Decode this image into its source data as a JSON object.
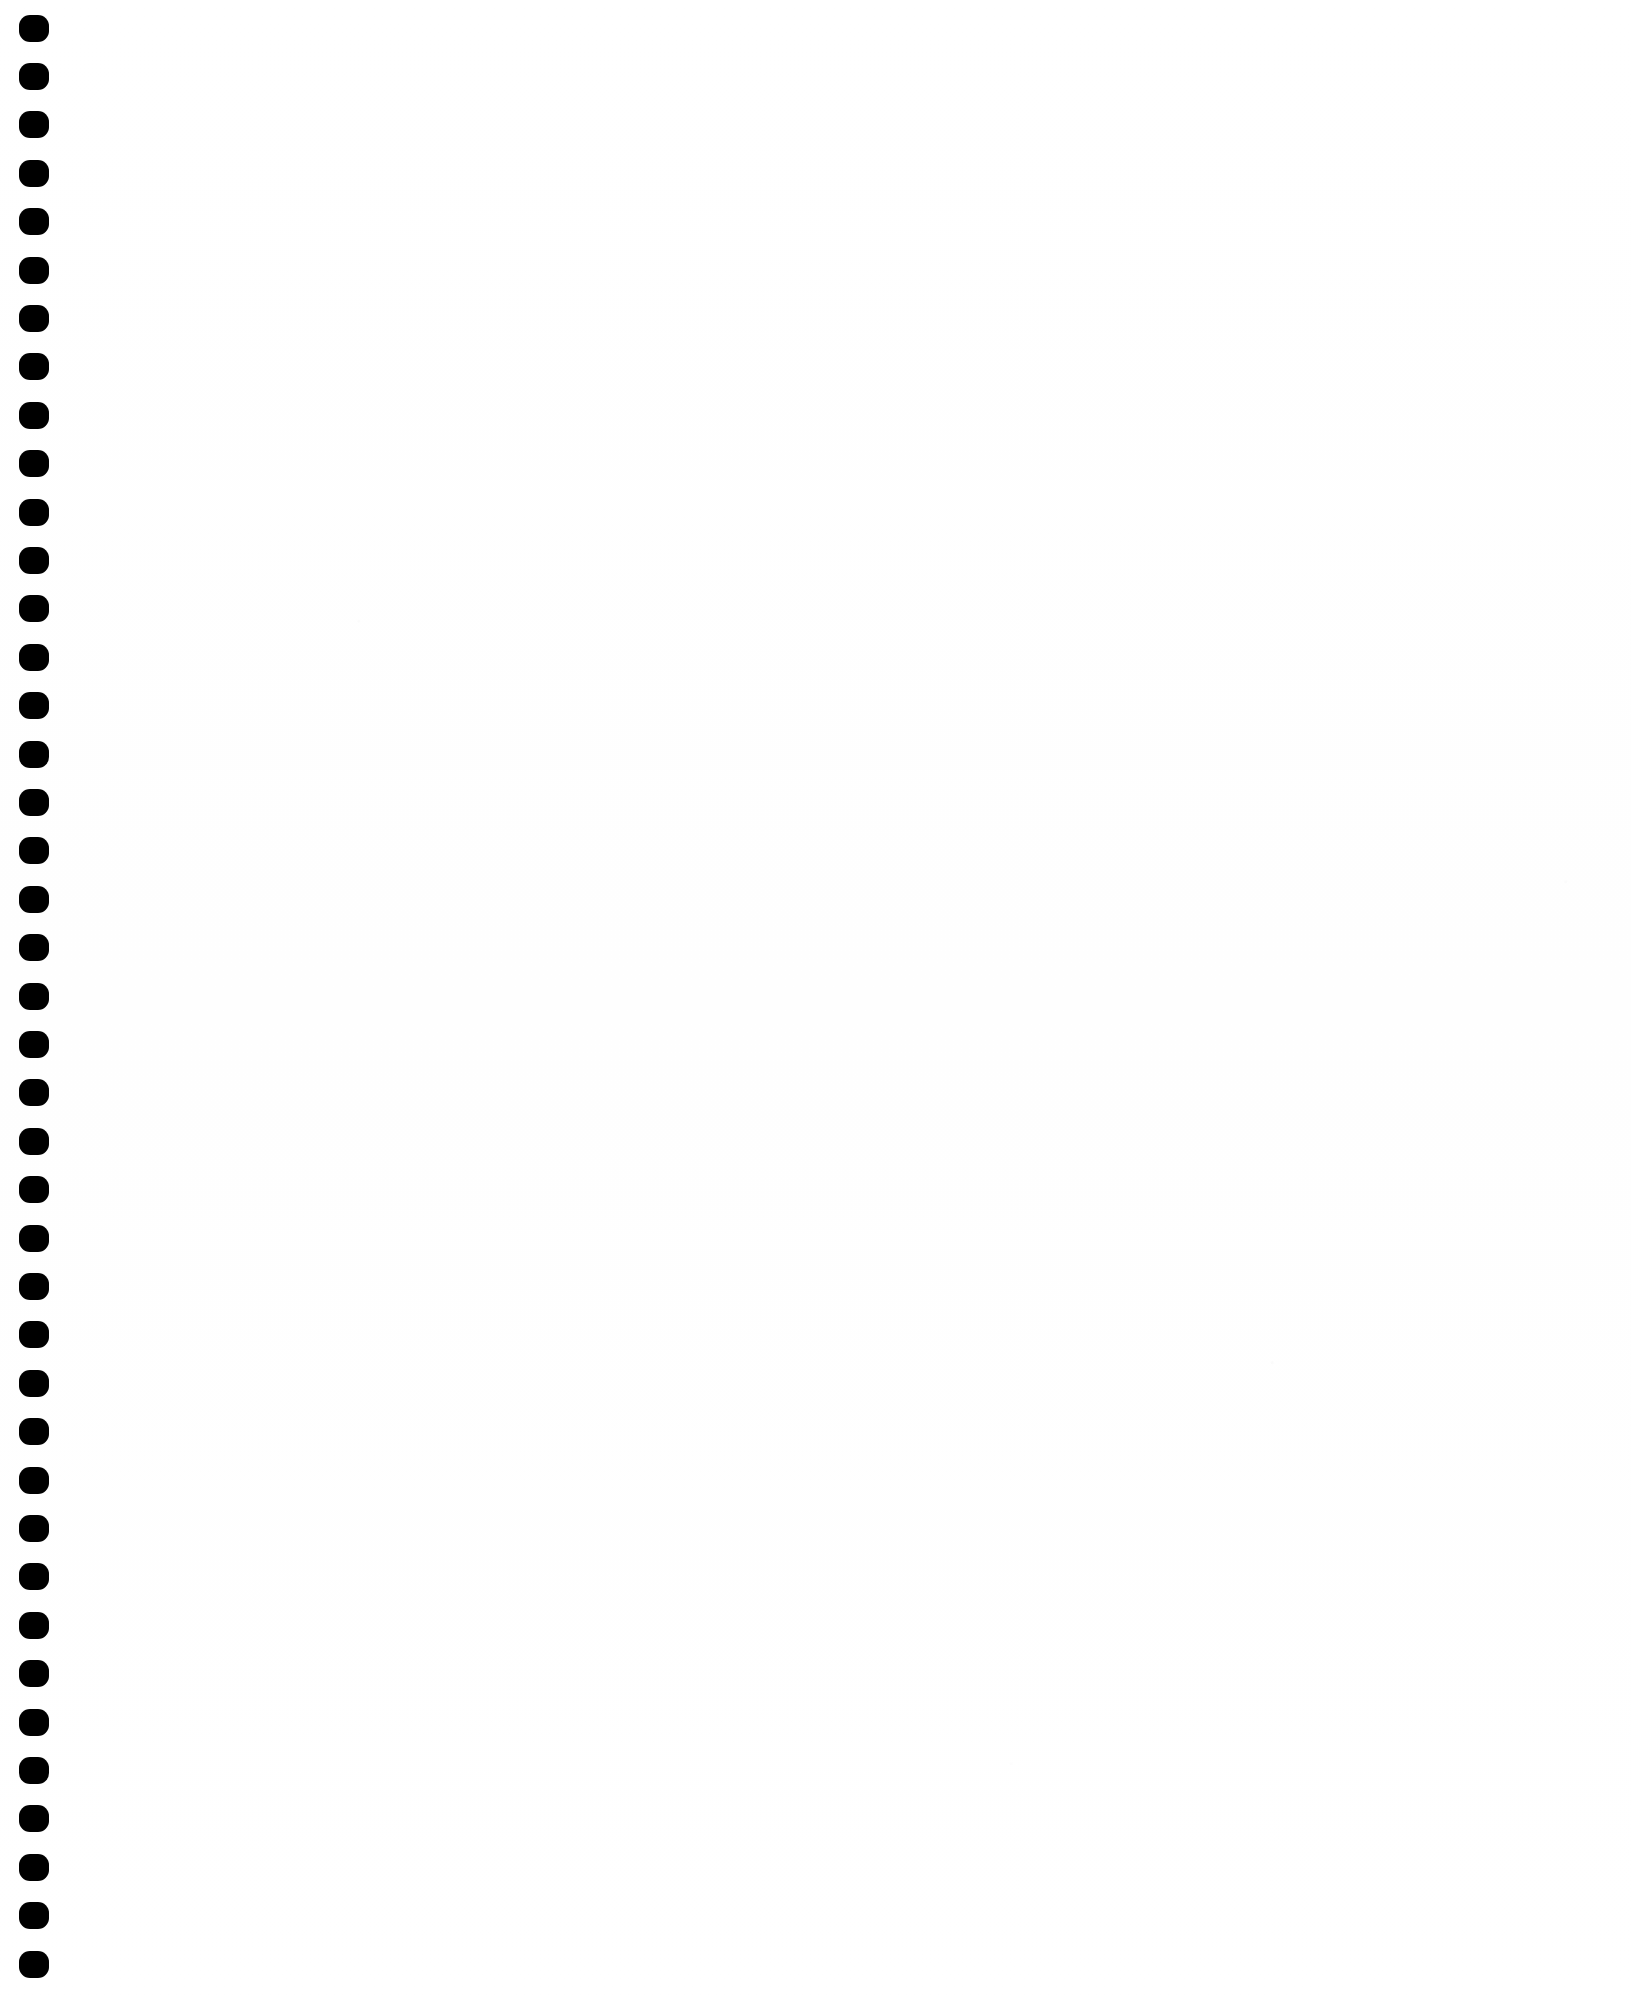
{
  "page": {
    "kind": "scanned-document-page",
    "width_px": 1631,
    "height_px": 2004,
    "background_color": "#ffffff",
    "visible_text": "",
    "body_text_lines": []
  },
  "binding": {
    "name": "spiral-binding-holes",
    "icon": "punch-hole-icon",
    "hole_count": 41,
    "hole_color": "#000000",
    "hole_width_px": 30,
    "hole_height_px": 27,
    "hole_corner_radius_px": 11,
    "first_hole_center_y_px": 28,
    "hole_pitch_px": 48.4,
    "hole_left_px": 19,
    "strip_width_px": 70
  },
  "content": {
    "name": "page-content-area",
    "is_blank": true,
    "text": ""
  }
}
